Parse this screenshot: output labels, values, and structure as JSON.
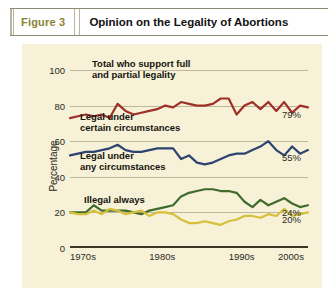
{
  "header": {
    "figure_label": "Figure 3",
    "title": "Opinion on the Legality of Abortions"
  },
  "colors": {
    "panel_background": "#f6f1d7",
    "grid": "#bdb89d",
    "axis": "#3a3524",
    "figure_label": "#8a8236",
    "series_red": "#9e3028",
    "series_blue": "#2d4470",
    "series_green": "#3f6b2c",
    "series_yellow": "#d6c03a"
  },
  "chart_data": {
    "type": "line",
    "title": "Opinion on the Legality of Abortions",
    "xlabel": "",
    "ylabel": "Percentage",
    "ylim": [
      0,
      100
    ],
    "yticks": [
      0,
      20,
      40,
      60,
      80,
      100
    ],
    "xticks": [
      "1970s",
      "1980s",
      "1990s",
      "2000s"
    ],
    "xlim": [
      1975,
      2005
    ],
    "grid": true,
    "legend": "inline-annotations",
    "x": [
      1975,
      1976,
      1977,
      1978,
      1979,
      1980,
      1981,
      1982,
      1983,
      1984,
      1985,
      1986,
      1987,
      1988,
      1989,
      1990,
      1991,
      1992,
      1993,
      1994,
      1995,
      1996,
      1997,
      1998,
      1999,
      2000,
      2001,
      2002,
      2003,
      2004,
      2005
    ],
    "series": [
      {
        "name": "Total who support full and partial legality",
        "color": "#9e3028",
        "end_label": "79%",
        "annotation": "Total who support full\nand partial legality",
        "values": [
          73,
          74,
          75,
          74,
          75,
          73,
          81,
          77,
          75,
          76,
          77,
          78,
          80,
          79,
          82,
          81,
          80,
          80,
          81,
          84,
          84,
          75,
          80,
          82,
          78,
          82,
          77,
          82,
          76,
          80,
          79
        ]
      },
      {
        "name": "Legal under certain circumstances",
        "color": "#2d4470",
        "end_label": "55%",
        "annotation": "Legal under\ncertain circumstances",
        "values": [
          52,
          53,
          54,
          54,
          55,
          56,
          58,
          55,
          54,
          54,
          55,
          56,
          56,
          56,
          50,
          52,
          48,
          47,
          48,
          50,
          52,
          53,
          53,
          55,
          57,
          60,
          55,
          52,
          57,
          53,
          55
        ]
      },
      {
        "name": "Legal under any circumstances",
        "color": "#3f6b2c",
        "end_label": "24%",
        "annotation": "Legal under\nany circumstances",
        "values": [
          20,
          20,
          20,
          24,
          21,
          21,
          21,
          21,
          20,
          19,
          21,
          22,
          23,
          24,
          29,
          31,
          32,
          33,
          33,
          32,
          32,
          31,
          26,
          23,
          27,
          24,
          26,
          28,
          25,
          23,
          24
        ]
      },
      {
        "name": "Illegal always",
        "color": "#d6c03a",
        "end_label": "20%",
        "annotation": "Illegal always",
        "values": [
          20,
          19,
          19,
          21,
          19,
          22,
          21,
          19,
          20,
          21,
          18,
          20,
          20,
          19,
          16,
          14,
          14,
          15,
          14,
          13,
          15,
          16,
          18,
          18,
          17,
          19,
          18,
          22,
          18,
          19,
          20
        ]
      }
    ]
  }
}
